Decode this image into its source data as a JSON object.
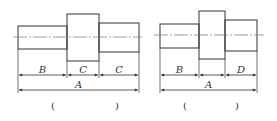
{
  "figures": [
    {
      "id": "left",
      "segments": [
        {
          "x": 18,
          "y": 26,
          "w": 49,
          "h": 23
        },
        {
          "x": 67,
          "y": 14,
          "w": 32,
          "h": 47
        },
        {
          "x": 99,
          "y": 23,
          "w": 40,
          "h": 29
        }
      ],
      "centerline": {
        "x1": 13,
        "x2": 142,
        "y": 37
      },
      "dim_row1": {
        "y": 75,
        "marks": [
          18,
          67,
          99,
          139
        ],
        "labels": [
          "B",
          "C",
          "C"
        ]
      },
      "dim_row2": {
        "y": 90,
        "x1": 18,
        "x2": 139,
        "label": "A"
      },
      "answer": {
        "open": "(",
        "close": ")",
        "x_open": 51,
        "x_close": 115,
        "y": 109
      }
    },
    {
      "id": "right",
      "segments": [
        {
          "x": 160,
          "y": 24,
          "w": 39,
          "h": 24
        },
        {
          "x": 199,
          "y": 11,
          "w": 26,
          "h": 48
        },
        {
          "x": 225,
          "y": 20,
          "w": 32,
          "h": 31
        }
      ],
      "centerline": {
        "x1": 154,
        "x2": 264,
        "y": 35
      },
      "dim_row1": {
        "y": 75,
        "marks": [
          160,
          199,
          225,
          257
        ],
        "labels": [
          "B",
          "",
          "D"
        ]
      },
      "dim_row2": {
        "y": 90,
        "x1": 160,
        "x2": 257,
        "label": "A"
      },
      "answer": {
        "open": "(",
        "close": ")",
        "x_open": 183,
        "x_close": 235,
        "y": 109
      }
    }
  ],
  "colors": {
    "stroke": "#333333",
    "centerline": "#777777"
  }
}
